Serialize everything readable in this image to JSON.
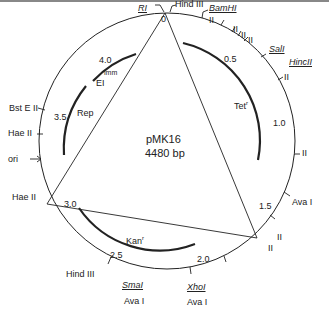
{
  "plasmid": {
    "name": "pMK16",
    "size": "4480 bp"
  },
  "scale": [
    "0",
    "0.5",
    "1.0",
    "1.5",
    "2.0",
    "2.5",
    "3.0",
    "3.5",
    "4.0"
  ],
  "sites": {
    "ri": "RI",
    "hind_top": "Hind III",
    "bamhi": "BamHI",
    "sali": "SalI",
    "hincii": "HincII",
    "ava_right": "Ava I",
    "xhoi": "XhoI",
    "ava_xho": "Ava I",
    "smai": "SmaI",
    "ava_sma": "Ava I",
    "hind_bottom": "Hind III",
    "hae_bottom": "Hae II",
    "ori": "ori",
    "hae_top": "Hae II",
    "bste": "Bst E II",
    "ii": "II"
  },
  "genes": {
    "tet": "Tet",
    "tet_sup": "r",
    "kan": "Kan",
    "kan_sup": "r",
    "rep": "Rep",
    "ei": "EI",
    "ei_sup": "imm"
  },
  "colors": {
    "line": "#222222",
    "background": "#ffffff"
  }
}
